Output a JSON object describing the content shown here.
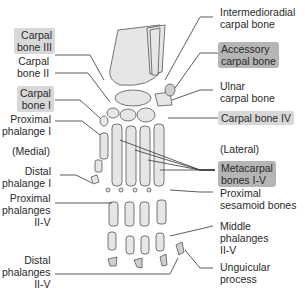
{
  "diagram": {
    "orientation": {
      "medial": "(Medial)",
      "lateral": "(Lateral)"
    },
    "labels_left": [
      {
        "id": "carpal-bone-iii",
        "text": "Carpal\nbone III",
        "highlighted": true
      },
      {
        "id": "carpal-bone-ii",
        "text": "Carpal\nbone II",
        "highlighted": false
      },
      {
        "id": "carpal-bone-i",
        "text": "Carpal\nbone I",
        "highlighted": true
      },
      {
        "id": "proximal-phalange-i",
        "text": "Proximal\nphalange I",
        "highlighted": false
      },
      {
        "id": "distal-phalange-i",
        "text": "Distal\nphalange I",
        "highlighted": false
      },
      {
        "id": "proximal-phalanges-ii-v",
        "text": "Proximal\nphalanges\nII-V",
        "highlighted": false
      },
      {
        "id": "distal-phalanges-ii-v",
        "text": "Distal\nphalanges\nII-V",
        "highlighted": false
      }
    ],
    "labels_right": [
      {
        "id": "intermedioradial-carpal-bone",
        "text": "Intermedioradial\ncarpal bone",
        "highlighted": false
      },
      {
        "id": "accessory-carpal-bone",
        "text": "Accessory\ncarpal bone",
        "highlighted": true
      },
      {
        "id": "ulnar-carpal-bone",
        "text": "Ulnar\ncarpal bone",
        "highlighted": false
      },
      {
        "id": "carpal-bone-iv",
        "text": "Carpal bone IV",
        "highlighted": true
      },
      {
        "id": "metacarpal-bones-i-v",
        "text": "Metacarpal\nbones I-V",
        "highlighted": true
      },
      {
        "id": "proximal-sesamoid-bones",
        "text": "Proximal\nsesamoid bones",
        "highlighted": false
      },
      {
        "id": "middle-phalanges-ii-v",
        "text": "Middle\nphalanges\nII-V",
        "highlighted": false
      },
      {
        "id": "unguicular-process",
        "text": "Unguicular\nprocess",
        "highlighted": false
      }
    ],
    "colors": {
      "highlight_light": "#d8d8d8",
      "highlight_dark": "#b5b5b5",
      "bone_fill": "#e6e6e6",
      "line": "#333333"
    }
  }
}
